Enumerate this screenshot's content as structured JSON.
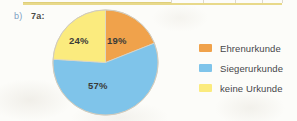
{
  "page": {
    "background_color": "#fcfcf9",
    "top_table_edge": {
      "name": "cut-off-table-bottom-border",
      "line_color": "#e8d98a",
      "divider_color": "#ded9cb",
      "divider_positions": [
        171,
        203,
        235,
        262,
        282
      ]
    }
  },
  "exercise": {
    "part_label": "b)",
    "part_label_color": "#7d9fc4",
    "task_label": "7a:",
    "task_label_color": "#4a4a46"
  },
  "chart_data": {
    "type": "pie",
    "title": "7a:",
    "xlabel": "",
    "ylabel": "",
    "categories": [
      "Ehrenurkunde",
      "Siegerurkunde",
      "keine Urkunde"
    ],
    "values": [
      19,
      57,
      24
    ],
    "value_labels": [
      "19%",
      "57%",
      "24%"
    ],
    "colors": [
      "#f0a24b",
      "#7fc4ea",
      "#fbeb7e"
    ],
    "start_angle_deg": 0,
    "direction": "clockwise",
    "legend_position": "right",
    "grid": false,
    "label_text_color": "#3b3b38",
    "stroke_color": "#d9d4c8"
  },
  "legend": {
    "items": [
      {
        "label": "Ehrenurkunde",
        "color": "#f0a24b"
      },
      {
        "label": "Siegerurkunde",
        "color": "#7fc4ea"
      },
      {
        "label": "keine Urkunde",
        "color": "#fbeb7e"
      }
    ],
    "text_color": "#46464a"
  }
}
